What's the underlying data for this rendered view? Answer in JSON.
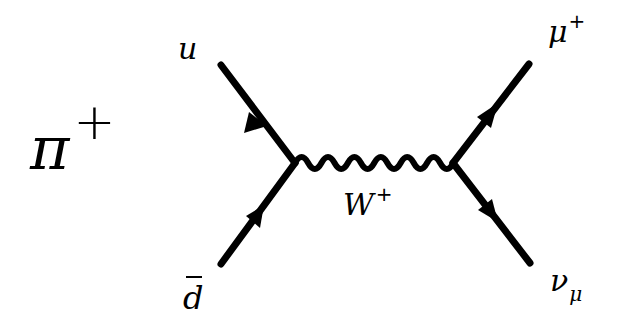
{
  "diagram": {
    "type": "Feynman diagram",
    "title_particle": {
      "symbol": "π",
      "charge": "+"
    },
    "incoming": [
      {
        "name": "u-quark",
        "label": "u"
      },
      {
        "name": "anti-d-quark",
        "label": "d"
      }
    ],
    "propagator": {
      "name": "W boson",
      "label": "W",
      "charge": "+"
    },
    "outgoing": [
      {
        "name": "anti-muon",
        "label": "μ",
        "charge": "+"
      },
      {
        "name": "muon-neutrino",
        "label": "ν",
        "subscript": "μ"
      }
    ],
    "colors": {
      "line": "#000000",
      "background": "#ffffff"
    }
  }
}
